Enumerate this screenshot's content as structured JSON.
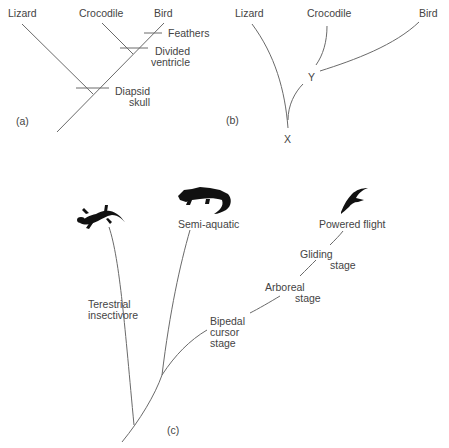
{
  "panel_a": {
    "label": "(a)",
    "taxa": [
      "Lizard",
      "Crocodile",
      "Bird"
    ],
    "characters": {
      "feathers": "Feathers",
      "divided_ventricle_1": "Divided",
      "divided_ventricle_2": "ventricle",
      "diapsid_skull_1": "Diapsid",
      "diapsid_skull_2": "skull"
    }
  },
  "panel_b": {
    "label": "(b)",
    "taxa": [
      "Lizard",
      "Crocodile",
      "Bird"
    ],
    "nodes": {
      "x": "X",
      "y": "Y"
    }
  },
  "panel_c": {
    "label": "(c)",
    "branches": {
      "terrestrial_1": "Terestrial",
      "terrestrial_2": "insectivore",
      "semi_aquatic": "Semi-aquatic",
      "bipedal_1": "Bipedal",
      "bipedal_2": "cursor",
      "bipedal_3": "stage",
      "arboreal_1": "Arboreal",
      "arboreal_2": "stage",
      "gliding_1": "Gliding",
      "gliding_2": "stage",
      "powered_flight": "Powered flight"
    }
  }
}
